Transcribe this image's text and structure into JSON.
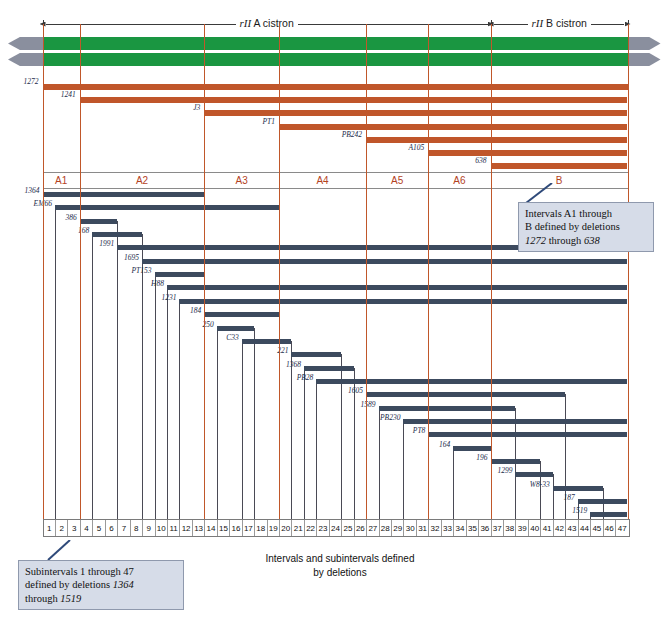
{
  "figure": {
    "caption_line1": "Intervals and subintervals defined",
    "caption_line2": "by deletions",
    "colors": {
      "cistron_green": "#1a9641",
      "deletion_orange": "#c0562a",
      "subdeletion_blue": "#3c4a5e",
      "boundary_line": "#c0572a",
      "callout_fill": "#d6dce8",
      "callout_border": "#8f99ad",
      "arrow_grey": "#8a8f9e"
    }
  },
  "cistrons": [
    {
      "name": "rII A cistron",
      "italic_part": "rII",
      "plain_part": " A cistron"
    },
    {
      "name": "rII B cistron",
      "italic_part": "rII",
      "plain_part": " B cistron"
    }
  ],
  "interval_deletions": [
    {
      "label": "1272",
      "start_interval": "A1"
    },
    {
      "label": "1241",
      "start_interval": "A2"
    },
    {
      "label": "J3",
      "start_interval": "A3"
    },
    {
      "label": "PT1",
      "start_interval": "A4"
    },
    {
      "label": "PB242",
      "start_interval": "A5"
    },
    {
      "label": "A105",
      "start_interval": "A6"
    },
    {
      "label": "638",
      "start_interval": "B"
    }
  ],
  "intervals": [
    {
      "label": "A1"
    },
    {
      "label": "A2"
    },
    {
      "label": "A3"
    },
    {
      "label": "A4"
    },
    {
      "label": "A5"
    },
    {
      "label": "A6"
    },
    {
      "label": "B"
    }
  ],
  "subinterval_deletions": [
    {
      "label": "1364"
    },
    {
      "label": "EM66"
    },
    {
      "label": "386"
    },
    {
      "label": "168"
    },
    {
      "label": "1991"
    },
    {
      "label": "1695"
    },
    {
      "label": "PT153"
    },
    {
      "label": "H88"
    },
    {
      "label": "1231"
    },
    {
      "label": "184"
    },
    {
      "label": "250"
    },
    {
      "label": "C33"
    },
    {
      "label": "221"
    },
    {
      "label": "1368"
    },
    {
      "label": "PB28"
    },
    {
      "label": "1605"
    },
    {
      "label": "1589"
    },
    {
      "label": "PB230"
    },
    {
      "label": "PT8"
    },
    {
      "label": "164"
    },
    {
      "label": "196"
    },
    {
      "label": "1299"
    },
    {
      "label": "W8-33"
    },
    {
      "label": "187"
    },
    {
      "label": "1519"
    }
  ],
  "subintervals": [
    "1",
    "2",
    "3",
    "4",
    "5",
    "6",
    "7",
    "8",
    "9",
    "10",
    "11",
    "12",
    "13",
    "14",
    "15",
    "16",
    "17",
    "18",
    "19",
    "20",
    "21",
    "22",
    "23",
    "24",
    "25",
    "26",
    "27",
    "28",
    "29",
    "30",
    "31",
    "32",
    "33",
    "34",
    "35",
    "36",
    "37",
    "38",
    "39",
    "40",
    "41",
    "42",
    "43",
    "44",
    "45",
    "46",
    "47"
  ],
  "callouts": {
    "intervals": {
      "line1": "Intervals A1 through",
      "line2": "B defined by deletions",
      "line3_pre": "1272",
      "line3_mid": " through ",
      "line3_post": "638"
    },
    "subintervals": {
      "line1": "Subintervals 1 through 47",
      "line2_pre": "defined by deletions ",
      "line2_num": "1364",
      "line3_pre": "through ",
      "line3_num": "1519"
    }
  },
  "chart_data": {
    "type": "table",
    "title": "Intervals and subintervals defined by deletions",
    "x_axis": {
      "name": "rII region subintervals",
      "min_sub": 1,
      "max_sub": 47
    },
    "interval_bounds_sub": {
      "A1": [
        1,
        3
      ],
      "A2": [
        4,
        13
      ],
      "A3": [
        14,
        19
      ],
      "A4": [
        20,
        26
      ],
      "A5": [
        27,
        31
      ],
      "A6": [
        32,
        36
      ],
      "B": [
        37,
        47
      ]
    },
    "interval_deletion_extents": [
      {
        "name": "1272",
        "start_sub": 1,
        "end_sub": 47
      },
      {
        "name": "1241",
        "start_sub": 4,
        "end_sub": 47
      },
      {
        "name": "J3",
        "start_sub": 14,
        "end_sub": 47
      },
      {
        "name": "PT1",
        "start_sub": 20,
        "end_sub": 47
      },
      {
        "name": "PB242",
        "start_sub": 27,
        "end_sub": 47
      },
      {
        "name": "A105",
        "start_sub": 32,
        "end_sub": 47
      },
      {
        "name": "638",
        "start_sub": 37,
        "end_sub": 47
      }
    ],
    "subinterval_deletion_extents": [
      {
        "name": "1364",
        "start_sub": 1,
        "end_sub": 13
      },
      {
        "name": "EM66",
        "start_sub": 2,
        "end_sub": 19
      },
      {
        "name": "386",
        "start_sub": 4,
        "end_sub": 6
      },
      {
        "name": "168",
        "start_sub": 5,
        "end_sub": 8
      },
      {
        "name": "1991",
        "start_sub": 7,
        "end_sub": 47
      },
      {
        "name": "1695",
        "start_sub": 9,
        "end_sub": 47
      },
      {
        "name": "PT153",
        "start_sub": 10,
        "end_sub": 13
      },
      {
        "name": "H88",
        "start_sub": 11,
        "end_sub": 47
      },
      {
        "name": "1231",
        "start_sub": 12,
        "end_sub": 47
      },
      {
        "name": "184",
        "start_sub": 14,
        "end_sub": 19
      },
      {
        "name": "250",
        "start_sub": 15,
        "end_sub": 17
      },
      {
        "name": "C33",
        "start_sub": 17,
        "end_sub": 20
      },
      {
        "name": "221",
        "start_sub": 21,
        "end_sub": 24
      },
      {
        "name": "1368",
        "start_sub": 22,
        "end_sub": 25
      },
      {
        "name": "PB28",
        "start_sub": 23,
        "end_sub": 47
      },
      {
        "name": "1605",
        "start_sub": 27,
        "end_sub": 42
      },
      {
        "name": "1589",
        "start_sub": 28,
        "end_sub": 38
      },
      {
        "name": "PB230",
        "start_sub": 30,
        "end_sub": 47
      },
      {
        "name": "PT8",
        "start_sub": 32,
        "end_sub": 47
      },
      {
        "name": "164",
        "start_sub": 34,
        "end_sub": 36
      },
      {
        "name": "196",
        "start_sub": 37,
        "end_sub": 40
      },
      {
        "name": "1299",
        "start_sub": 39,
        "end_sub": 41
      },
      {
        "name": "W8-33",
        "start_sub": 42,
        "end_sub": 45
      },
      {
        "name": "187",
        "start_sub": 44,
        "end_sub": 47
      },
      {
        "name": "1519",
        "start_sub": 45,
        "end_sub": 47
      }
    ]
  }
}
